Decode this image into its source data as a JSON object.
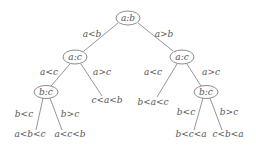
{
  "diagram": {
    "type": "decision-tree",
    "nodes": [
      {
        "id": "root",
        "label": "a:b",
        "x": 128,
        "y": 18
      },
      {
        "id": "l",
        "label": "a:c",
        "x": 75,
        "y": 57
      },
      {
        "id": "r",
        "label": "a:c",
        "x": 182,
        "y": 57
      },
      {
        "id": "ll",
        "label": "b:c",
        "x": 46,
        "y": 92
      },
      {
        "id": "rr",
        "label": "b:c",
        "x": 206,
        "y": 92
      }
    ],
    "leaves": [
      {
        "id": "lr",
        "label": "c<a<b",
        "x": 107,
        "y": 103
      },
      {
        "id": "rl",
        "label": "b<a<c",
        "x": 153,
        "y": 105
      },
      {
        "id": "lll",
        "label": "a<b<c",
        "x": 30,
        "y": 137
      },
      {
        "id": "llr",
        "label": "a<c<b",
        "x": 70,
        "y": 137
      },
      {
        "id": "rrl",
        "label": "b<c<a",
        "x": 191,
        "y": 137
      },
      {
        "id": "rrr",
        "label": "c<b<a",
        "x": 228,
        "y": 137
      }
    ],
    "edge_labels": [
      {
        "label": "a<b",
        "x": 92,
        "y": 37
      },
      {
        "label": "a>b",
        "x": 164,
        "y": 37
      },
      {
        "label": "a<c",
        "x": 49,
        "y": 75
      },
      {
        "label": "a>c",
        "x": 102,
        "y": 75
      },
      {
        "label": "a<c",
        "x": 153,
        "y": 75
      },
      {
        "label": "a>c",
        "x": 211,
        "y": 75
      },
      {
        "label": "b<c",
        "x": 24,
        "y": 117
      },
      {
        "label": "b>c",
        "x": 70,
        "y": 117
      },
      {
        "label": "b<c",
        "x": 186,
        "y": 115
      },
      {
        "label": "b>c",
        "x": 229,
        "y": 115
      }
    ]
  }
}
